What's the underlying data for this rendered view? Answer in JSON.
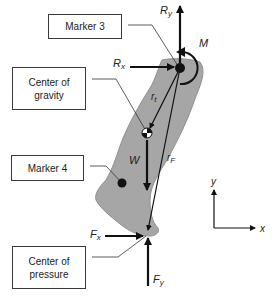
{
  "diagram": {
    "type": "free-body diagram",
    "boxes": {
      "marker3": "Marker 3",
      "center_of_gravity": "Center of\ngravity",
      "marker4": "Marker 4",
      "center_of_pressure": "Center of\npressure"
    },
    "forces": {
      "ry": {
        "base": "R",
        "sub": "y"
      },
      "rx": {
        "base": "R",
        "sub": "x"
      },
      "moment": {
        "base": "M",
        "sub": ""
      },
      "weight": {
        "base": "W",
        "sub": ""
      },
      "fx": {
        "base": "F",
        "sub": "x"
      },
      "fy": {
        "base": "F",
        "sub": "y"
      }
    },
    "vectors": {
      "rt": {
        "base": "r",
        "sub": "t"
      },
      "rf": {
        "base": "r",
        "sub": "F"
      }
    },
    "axes": {
      "x": "x",
      "y": "y"
    },
    "colors": {
      "segment_fill": "#a6a6a6",
      "segment_outline": "#8a8a8a",
      "ink": "#111111",
      "box_border": "#3a3a3a"
    }
  }
}
